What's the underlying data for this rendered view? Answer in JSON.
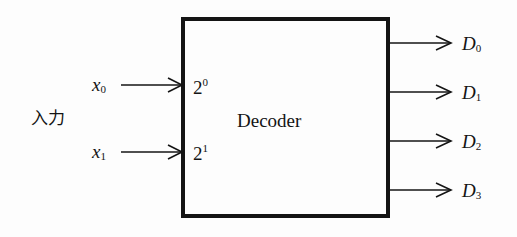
{
  "diagram": {
    "title": "Decoder",
    "input_group_label": "入力",
    "inputs": [
      {
        "var": "x",
        "sub": "0",
        "port_base": "2",
        "port_exp": "0"
      },
      {
        "var": "x",
        "sub": "1",
        "port_base": "2",
        "port_exp": "1"
      }
    ],
    "outputs": [
      {
        "var": "D",
        "sub": "0"
      },
      {
        "var": "D",
        "sub": "1"
      },
      {
        "var": "D",
        "sub": "2"
      },
      {
        "var": "D",
        "sub": "3"
      }
    ],
    "colors": {
      "ink": "#141414",
      "background": "#fdfdfd"
    }
  }
}
